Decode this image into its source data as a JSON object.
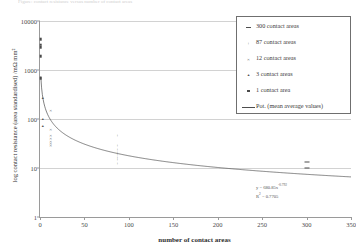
{
  "caption": "Figure: contact resistance versus number of contact areas",
  "chart_data": {
    "type": "scatter",
    "title": "",
    "xlabel": "number of contact areas",
    "ylabel": "log contact resistance (area standardised) /mΩ mm²",
    "xlim": [
      0,
      350
    ],
    "ylim": [
      1,
      10000
    ],
    "yscale": "log",
    "xticks": [
      "0",
      "50",
      "100",
      "150",
      "200",
      "250",
      "300",
      "350"
    ],
    "xtick_values": [
      0,
      50,
      100,
      150,
      200,
      250,
      300,
      350
    ],
    "yticks": [
      "10000",
      "1000",
      "100",
      "10",
      "1"
    ],
    "ytick_values": [
      10000,
      1000,
      100,
      10,
      1
    ],
    "grid": true,
    "legend_position": "top-right",
    "series": [
      {
        "name": "300 contact areas",
        "marker": "dash",
        "points": [
          {
            "x": 300,
            "y": 13.5
          },
          {
            "x": 300,
            "y": 10.2
          }
        ]
      },
      {
        "name": "87 contact areas",
        "marker": "plus",
        "points": [
          {
            "x": 87,
            "y": 48
          },
          {
            "x": 87,
            "y": 30
          },
          {
            "x": 87,
            "y": 24
          },
          {
            "x": 87,
            "y": 21
          },
          {
            "x": 87,
            "y": 19
          },
          {
            "x": 87,
            "y": 17
          },
          {
            "x": 87,
            "y": 15
          },
          {
            "x": 87,
            "y": 12.5
          }
        ]
      },
      {
        "name": "12 contact areas",
        "marker": "cross",
        "points": [
          {
            "x": 12,
            "y": 150
          },
          {
            "x": 12,
            "y": 62
          },
          {
            "x": 12,
            "y": 48
          },
          {
            "x": 12,
            "y": 41
          },
          {
            "x": 12,
            "y": 36
          },
          {
            "x": 12,
            "y": 32
          },
          {
            "x": 12,
            "y": 29
          }
        ]
      },
      {
        "name": "3 contact areas",
        "marker": "triangle",
        "points": [
          {
            "x": 3,
            "y": 270
          },
          {
            "x": 3,
            "y": 100
          },
          {
            "x": 3,
            "y": 72
          }
        ]
      },
      {
        "name": "1 contact area",
        "marker": "square",
        "points": [
          {
            "x": 1,
            "y": 4200
          },
          {
            "x": 1,
            "y": 3300
          },
          {
            "x": 1,
            "y": 2900
          },
          {
            "x": 1,
            "y": 1900
          },
          {
            "x": 1,
            "y": 680
          }
        ]
      }
    ],
    "trendline": {
      "name": "Pot. (mean average values)",
      "equation": "y = 680.85x",
      "exponent": "-0.792",
      "r2_label": "R",
      "r2_sup": "2",
      "r2_value": " = 0.7705",
      "coefficient": 680.85,
      "power": -0.792,
      "r_squared": 0.7705
    }
  },
  "legend": {
    "items": [
      {
        "label": "300 contact areas",
        "marker": "dash"
      },
      {
        "label": "87 contact areas",
        "marker": "plus"
      },
      {
        "label": "12 contact areas",
        "marker": "cross"
      },
      {
        "label": "3 contact areas",
        "marker": "triangle"
      },
      {
        "label": "1 contact area",
        "marker": "square"
      },
      {
        "label": "Pot. (mean average values)",
        "marker": "line"
      }
    ]
  }
}
